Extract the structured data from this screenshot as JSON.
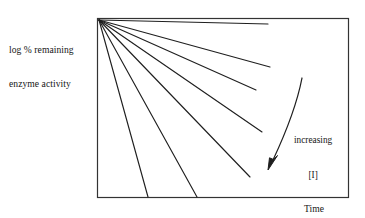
{
  "figure": {
    "name": "enzyme-inactivation-schematic",
    "background_color": "#ffffff",
    "ink_color": "#1a1a1a"
  },
  "axes": {
    "y_label_line1": "log % remaining",
    "y_label_line2": "enzyme activity",
    "x_label": "Time",
    "frame": {
      "left": 97,
      "top": 18,
      "right": 348,
      "bottom": 197,
      "stroke_color": "#333333",
      "stroke_width": 1.2
    },
    "ticks": [],
    "tick_labels": []
  },
  "annotation": {
    "line1": "increasing",
    "line2": "[I]",
    "arrow_name": "increasing-inhibitor-arrow",
    "arrow_start": [
      302,
      78
    ],
    "arrow_end": [
      268,
      168
    ]
  },
  "chart_data": {
    "type": "line",
    "title": "",
    "subtitle": "",
    "xlabel": "Time",
    "ylabel": "log % remaining enzyme activity",
    "xlim": [
      0,
      100
    ],
    "ylim": [
      0,
      100
    ],
    "grid": false,
    "legend": null,
    "legend_position": "none",
    "axis_ticks_shown": false,
    "note": "Semi-log plot of first-order enzyme inactivation. All seven lines start at the same intercept (top-left, 100% activity at time zero) and fall with progressively steeper slopes as inhibitor concentration [I] increases.",
    "x": [
      0,
      100
    ],
    "series": [
      {
        "name": "line-1-lowest-inhibitor",
        "slope_rank": 1,
        "x": [
          0,
          68
        ],
        "values": [
          100,
          96.6
        ],
        "pixel_start": [
          99,
          20
        ],
        "pixel_end": [
          268,
          24
        ]
      },
      {
        "name": "line-2",
        "slope_rank": 2,
        "x": [
          0,
          69
        ],
        "values": [
          100,
          73.7
        ],
        "pixel_start": [
          99,
          20
        ],
        "pixel_end": [
          270,
          67
        ]
      },
      {
        "name": "line-3",
        "slope_rank": 3,
        "x": [
          0,
          63
        ],
        "values": [
          100,
          60.9
        ],
        "pixel_start": [
          99,
          20
        ],
        "pixel_end": [
          256,
          90
        ]
      },
      {
        "name": "line-4",
        "slope_rank": 4,
        "x": [
          0,
          65
        ],
        "values": [
          100,
          37.4
        ],
        "pixel_start": [
          99,
          20
        ],
        "pixel_end": [
          262,
          132
        ]
      },
      {
        "name": "line-5",
        "slope_rank": 5,
        "x": [
          0,
          60
        ],
        "values": [
          100,
          12.3
        ],
        "pixel_start": [
          99,
          20
        ],
        "pixel_end": [
          250,
          177
        ]
      },
      {
        "name": "line-6",
        "slope_rank": 6,
        "x": [
          0,
          39
        ],
        "values": [
          100,
          0
        ],
        "pixel_start": [
          99,
          20
        ],
        "pixel_end": [
          197,
          197
        ]
      },
      {
        "name": "line-7-highest-inhibitor",
        "slope_rank": 7,
        "x": [
          0,
          20
        ],
        "values": [
          100,
          0
        ],
        "pixel_start": [
          99,
          20
        ],
        "pixel_end": [
          148,
          197
        ]
      }
    ],
    "annotations": [
      {
        "text": "increasing [I]",
        "type": "curved-arrow",
        "from": [
          302,
          78
        ],
        "to": [
          268,
          168
        ],
        "meaning": "direction of increasing inhibitor concentration"
      }
    ]
  }
}
